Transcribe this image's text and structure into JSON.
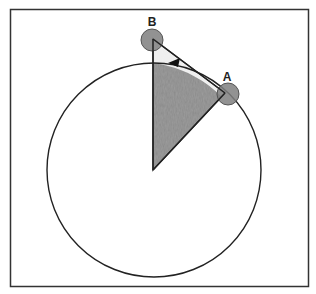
{
  "diagram": {
    "type": "geometry-circle-sector",
    "frame": {
      "x": 10,
      "y": 9,
      "width": 299,
      "height": 278,
      "stroke": "#333333"
    },
    "circle": {
      "cx": 154,
      "cy": 170,
      "r": 107,
      "stroke": "#222222"
    },
    "center": {
      "x": 153,
      "y": 170
    },
    "points": [
      {
        "id": "B",
        "label": "B",
        "x": 153,
        "y": 39,
        "marker_r": 11,
        "label_x": 152,
        "label_y": 26
      },
      {
        "id": "A",
        "label": "A",
        "x": 225,
        "y": 93,
        "marker_r": 11,
        "label_x": 227,
        "label_y": 81
      }
    ],
    "triangle": {
      "vertices": [
        "center",
        "B",
        "A"
      ],
      "fill": "#8a8a8a",
      "stroke": "#222222"
    },
    "arrow": {
      "description": "arrow along arc from A toward B",
      "tip": {
        "x": 168,
        "y": 63
      },
      "color": "#111111"
    },
    "colors": {
      "shade": "#8a8a8a",
      "marker": "#7f7f7f",
      "marker_stroke": "#555555",
      "line": "#222222"
    }
  },
  "labels": {
    "point_b": "B",
    "point_a": "A"
  }
}
